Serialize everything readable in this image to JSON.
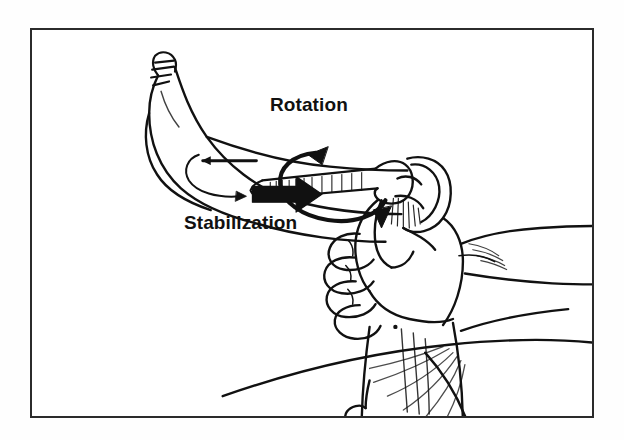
{
  "figure": {
    "kind": "anatomical-line-drawing",
    "background_color": "#ffffff",
    "ink_color": "#111111",
    "frame": {
      "visible": true,
      "border_color": "#2b2b2b",
      "border_width_px": 2,
      "x": 30,
      "y": 28,
      "width": 564,
      "height": 390
    },
    "annotations": [
      {
        "id": "rotation",
        "label": "Rotation",
        "arrow": "curved-circular-arrow",
        "arrow_direction": "clockwise-around-tibial-shaft",
        "x": 238,
        "y": 64
      },
      {
        "id": "stabilization",
        "label": "Stabilization",
        "arrow": "solid-block-arrow",
        "arrow_direction": "right",
        "x": 152,
        "y": 182
      },
      {
        "id": "traction",
        "label": "",
        "arrow": "thin-straight-arrow",
        "arrow_direction": "left",
        "x": 196,
        "y": 122
      }
    ],
    "anatomy_parts": [
      "foot",
      "toes",
      "ankle",
      "lower-leg",
      "tibia-shaft",
      "knee-joint",
      "femoral-condyles",
      "examiner-hand",
      "examiner-fingers",
      "examiner-thumb",
      "examiner-forearm",
      "patient-thigh",
      "patient-trunk"
    ]
  },
  "labels": {
    "rotation": "Rotation",
    "stabilization": "Stabilization"
  }
}
